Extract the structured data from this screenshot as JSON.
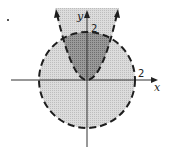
{
  "diagram": {
    "axes": {
      "x_label": "x",
      "y_label": "y",
      "x_tick_label": "2",
      "y_tick_label": "2"
    },
    "curves": [
      {
        "name": "circle",
        "equation": "x^2 + y^2 = 4",
        "style": "dashed",
        "radius": 2
      },
      {
        "name": "parabola",
        "equation": "y = x^2",
        "style": "dashed",
        "vertex": [
          0,
          0
        ]
      }
    ],
    "regions": [
      {
        "name": "disk-interior",
        "fill": "#d4d4d4"
      },
      {
        "name": "above-parabola",
        "fill": "#d4d4d4"
      },
      {
        "name": "intersection",
        "fill": "#8f8f8f"
      }
    ],
    "colors": {
      "light_shade": "#d4d4d4",
      "dark_shade": "#8f8f8f",
      "stroke": "#1e1e1e"
    }
  }
}
